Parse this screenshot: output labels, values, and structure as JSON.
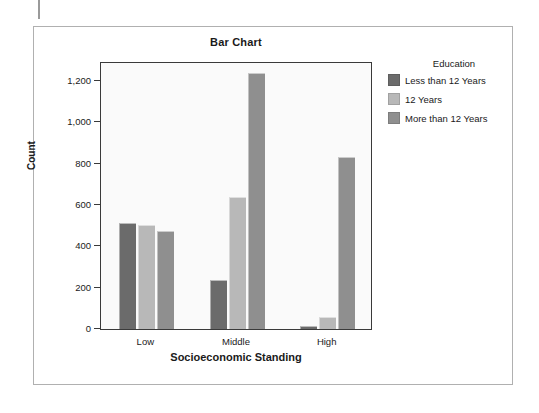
{
  "figure": {
    "title": "Bar Chart"
  },
  "legend": {
    "title": "Education",
    "entries": [
      {
        "label": "Less than 12 Years",
        "color": "#6b6b6b"
      },
      {
        "label": "12 Years",
        "color": "#b8b8b8"
      },
      {
        "label": "More than 12 Years",
        "color": "#8f8f8f"
      }
    ]
  },
  "chart_data": {
    "type": "bar",
    "title": "Bar Chart",
    "xlabel": "Socioeconomic Standing",
    "ylabel": "Count",
    "categories": [
      "Low",
      "Middle",
      "High"
    ],
    "series": [
      {
        "name": "Less than 12 Years",
        "color": "#6b6b6b",
        "values": [
          513,
          237,
          15
        ]
      },
      {
        "name": "12 Years",
        "color": "#b8b8b8",
        "values": [
          503,
          639,
          58
        ]
      },
      {
        "name": "More than 12 Years",
        "color": "#8f8f8f",
        "values": [
          474,
          1238,
          832
        ]
      }
    ],
    "ylim": [
      0,
      1200
    ],
    "ytick_values": [
      0,
      200,
      400,
      600,
      800,
      1000,
      1200
    ],
    "ytick_labels": [
      "0",
      "200",
      "400",
      "600",
      "800",
      "1,000",
      "1,200"
    ],
    "grid": false,
    "legend_position": "right",
    "legend_title": "Education",
    "bar_group_mode": "grouped"
  }
}
